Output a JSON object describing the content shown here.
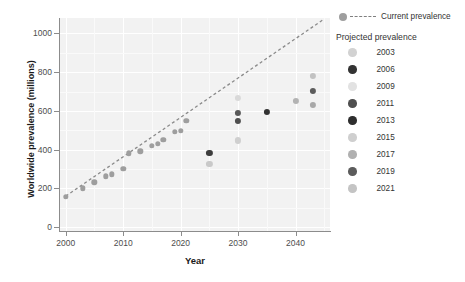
{
  "chart_data": {
    "type": "scatter",
    "title": "",
    "xlabel": "Year",
    "ylabel": "Worldwide prevalence (millions)",
    "xlim": [
      1999,
      2046
    ],
    "ylim": [
      -20,
      1080
    ],
    "xticks": [
      "2000",
      "2010",
      "2020",
      "2030",
      "2040"
    ],
    "xtick_values": [
      2000,
      2010,
      2020,
      2030,
      2040
    ],
    "yticks": [
      "0",
      "200",
      "400",
      "600",
      "800",
      "1000"
    ],
    "ytick_values": [
      0,
      200,
      400,
      600,
      800,
      1000
    ],
    "grid": true,
    "legend_position": "right",
    "series": [
      {
        "name": "Current prevalence",
        "marker": "circle",
        "line": "dashed",
        "color": "#9e9e9e",
        "points": [
          {
            "x": 2000,
            "y": 158
          },
          {
            "x": 2003,
            "y": 200
          },
          {
            "x": 2005,
            "y": 231
          },
          {
            "x": 2007,
            "y": 263
          },
          {
            "x": 2008,
            "y": 272
          },
          {
            "x": 2010,
            "y": 300
          },
          {
            "x": 2011,
            "y": 382
          },
          {
            "x": 2013,
            "y": 392
          },
          {
            "x": 2015,
            "y": 420
          },
          {
            "x": 2016,
            "y": 430
          },
          {
            "x": 2017,
            "y": 450
          },
          {
            "x": 2019,
            "y": 492
          },
          {
            "x": 2020,
            "y": 498
          },
          {
            "x": 2021,
            "y": 548
          }
        ],
        "trendline": {
          "x0": 2000,
          "y0": 160,
          "x1": 2045,
          "y1": 1075
        }
      },
      {
        "name": "Projected prevalence",
        "marker": "circle",
        "points": [
          {
            "x": 2025,
            "y": 385,
            "year_group": "2013",
            "color": "#3d3d3d"
          },
          {
            "x": 2025,
            "y": 325,
            "year_group": "2015",
            "color": "#c9c9c9"
          },
          {
            "x": 2030,
            "y": 668,
            "year_group": "2009",
            "color": "#d9d9d9"
          },
          {
            "x": 2030,
            "y": 590,
            "year_group": "2019",
            "color": "#595959"
          },
          {
            "x": 2030,
            "y": 550,
            "year_group": "2011",
            "color": "#4f4f4f"
          },
          {
            "x": 2030,
            "y": 448,
            "year_group": "2021",
            "color": "#cfcfcf"
          },
          {
            "x": 2035,
            "y": 595,
            "year_group": "2006",
            "color": "#333333"
          },
          {
            "x": 2040,
            "y": 650,
            "year_group": "2017",
            "color": "#b3b3b3"
          },
          {
            "x": 2043,
            "y": 782,
            "year_group": "2003",
            "color": "#c2c2c2"
          },
          {
            "x": 2043,
            "y": 703,
            "year_group": "2019",
            "color": "#5c5c5c"
          },
          {
            "x": 2043,
            "y": 632,
            "year_group": "2017",
            "color": "#a8a8a8"
          }
        ]
      }
    ]
  },
  "legend": {
    "current": {
      "label": "Current prevalence",
      "dot_color": "#9e9e9e",
      "line_color": "#7f7f7f"
    },
    "projected": {
      "title": "Projected prevalence",
      "items": [
        {
          "label": "2003",
          "color": "#d2d2d2"
        },
        {
          "label": "2006",
          "color": "#333333"
        },
        {
          "label": "2009",
          "color": "#e2e2e2"
        },
        {
          "label": "2011",
          "color": "#4f4f4f"
        },
        {
          "label": "2013",
          "color": "#2e2e2e"
        },
        {
          "label": "2015",
          "color": "#cfcfcf"
        },
        {
          "label": "2017",
          "color": "#b0b0b0"
        },
        {
          "label": "2019",
          "color": "#5c5c5c"
        },
        {
          "label": "2021",
          "color": "#c4c4c4"
        }
      ]
    }
  }
}
